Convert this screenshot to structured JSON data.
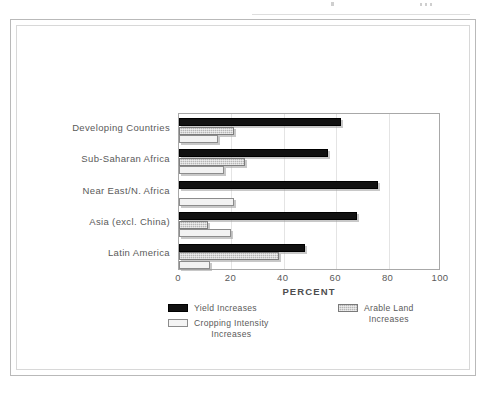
{
  "figure": {
    "x_axis_title": "PERCENT",
    "plot_border_color": "#a8a8a8",
    "frame_color": "#b9b9b9"
  },
  "chart_data": {
    "type": "bar",
    "orientation": "horizontal",
    "title": "",
    "xlabel": "PERCENT",
    "ylabel": "",
    "xlim": [
      0,
      100
    ],
    "xticks": [
      0,
      20,
      40,
      60,
      80,
      100
    ],
    "grid": true,
    "legend_position": "bottom",
    "categories": [
      "Developing Countries",
      "Sub-Saharan Africa",
      "Near East/N. Africa",
      "Asia (excl. China)",
      "Latin America"
    ],
    "series": [
      {
        "name": "Yield Increases",
        "color": "#111111",
        "values": [
          62,
          57,
          76,
          68,
          48
        ]
      },
      {
        "name": "Arable Land Increases",
        "color": "#b6b6b6",
        "values": [
          21,
          25,
          0,
          11,
          38
        ]
      },
      {
        "name": "Cropping Intensity Increases",
        "color": "#f2f2f2",
        "values": [
          15,
          17,
          21,
          20,
          12
        ]
      }
    ]
  },
  "legend": {
    "items": [
      {
        "label": "Yield Increases",
        "swatch": "black"
      },
      {
        "label": "Arable Land\nIncreases",
        "swatch": "gray"
      },
      {
        "label": "Cropping Intensity\nIncreases",
        "swatch": "white"
      }
    ]
  },
  "axis": {
    "tick_labels": [
      "0",
      "20",
      "40",
      "60",
      "80",
      "100"
    ]
  }
}
